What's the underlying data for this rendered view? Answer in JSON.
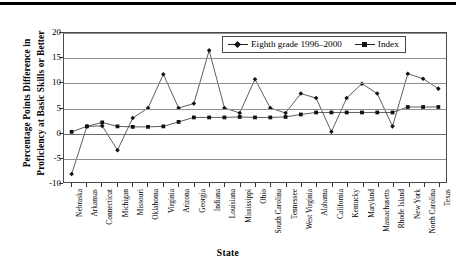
{
  "chart_data": {
    "type": "line",
    "title": "",
    "xlabel": "State",
    "ylabel_line1": "Percentage Points Difference in",
    "ylabel_line2": "Proficiency at Basic Skills or Better",
    "ylim": [
      -10,
      20
    ],
    "yticks": [
      20,
      15,
      10,
      5,
      0,
      -5,
      -10
    ],
    "ytick_labels": [
      "20",
      "15",
      "10",
      "5",
      "0",
      "-5",
      "-10"
    ],
    "grid": true,
    "legend_position": "top-right",
    "categories": [
      "Nebraska",
      "Arkansas",
      "Connecticut",
      "Michigan",
      "Missouri",
      "Oklahoma",
      "Virginia",
      "Arizona",
      "Georgia",
      "Indiana",
      "Louisiana",
      "Mississippi",
      "Ohio",
      "South Carolina",
      "Tennessee",
      "West Virginia",
      "Alabama",
      "California",
      "Kentucky",
      "Maryland",
      "Massachusetts",
      "Rhode Island",
      "New York",
      "North Carolina",
      "Texas"
    ],
    "series": [
      {
        "name": "Eighth grade 1996–2000",
        "marker": "diamond",
        "values": [
          -8.4,
          1.2,
          1.3,
          -3.6,
          2.9,
          4.9,
          11.7,
          4.9,
          5.8,
          16.5,
          4.9,
          3.9,
          10.7,
          4.9,
          3.9,
          7.8,
          6.9,
          0.1,
          6.9,
          9.8,
          7.8,
          1.2,
          11.8,
          10.8,
          8.8
        ]
      },
      {
        "name": "Index",
        "marker": "square",
        "values": [
          0.1,
          1.2,
          2.0,
          1.2,
          1.1,
          1.1,
          1.2,
          2.1,
          3.0,
          3.0,
          3.0,
          3.1,
          3.0,
          3.0,
          3.1,
          3.6,
          4.0,
          4.0,
          4.0,
          4.0,
          4.0,
          4.0,
          5.1,
          5.1,
          5.1
        ]
      }
    ]
  }
}
